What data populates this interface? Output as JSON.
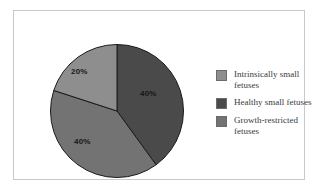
{
  "chart_data": {
    "type": "pie",
    "title": "",
    "subtitle": "",
    "xlabel": "",
    "ylabel": "",
    "grid": false,
    "legend_position": "right",
    "start_angle_deg": 0,
    "direction": "clockwise",
    "categories": [
      "Intrinsically small fetuses",
      "Healthy small fetuses",
      "Growth-restricted fetuses"
    ],
    "values": [
      20,
      40,
      40
    ],
    "value_labels": [
      "20%",
      "40%",
      "40%"
    ],
    "colors": [
      "#8e8e8e",
      "#4a4a4a",
      "#737373"
    ],
    "slices": [
      {
        "name": "Healthy small fetuses",
        "value": 40,
        "label": "40%",
        "color": "#4a4a4a",
        "start_deg": 0,
        "end_deg": 144
      },
      {
        "name": "Growth-restricted fetuses",
        "value": 40,
        "label": "40%",
        "color": "#737373",
        "start_deg": 144,
        "end_deg": 288
      },
      {
        "name": "Intrinsically small fetuses",
        "value": 20,
        "label": "20%",
        "color": "#8e8e8e",
        "start_deg": 288,
        "end_deg": 360
      }
    ]
  },
  "legend": {
    "items": [
      {
        "label": "Intrinsically small fetuses",
        "color": "#8e8e8e"
      },
      {
        "label": "Healthy small fetuses",
        "color": "#4a4a4a"
      },
      {
        "label": "Growth-restricted fetuses",
        "color": "#737373"
      }
    ]
  },
  "labels": {
    "healthy": "40%",
    "growth": "40%",
    "intrinsic": "20%"
  },
  "style": {
    "frame_border_color": "#c9c9c9",
    "background": "#ffffff",
    "slice_edge_color": "#1a1a1a",
    "label_text_color": "#171717",
    "legend_text_color": "#3a3a3a"
  }
}
